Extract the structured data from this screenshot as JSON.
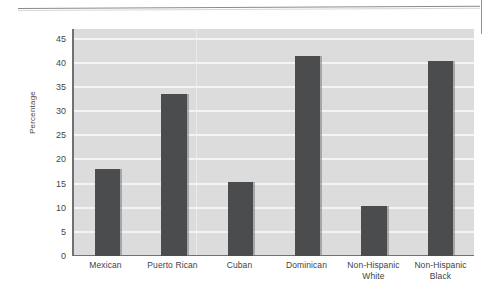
{
  "figure": {
    "type": "scanned-bar-chart",
    "background_color": "#ffffff",
    "plot_background_color": "#dcdcdc",
    "bar_color": "#4b4c4e",
    "gridline_color": "#f4f4f4",
    "axis_color": "#6f7173"
  },
  "chart_data": {
    "type": "bar",
    "title": "",
    "subtitle": "",
    "xlabel": "",
    "ylabel": "Percentage",
    "categories": [
      "Mexican",
      "Puerto Rican",
      "Cuban",
      "Dominican",
      "Non-Hispanic White",
      "Non-Hispanic Black"
    ],
    "category_lines": [
      [
        "Mexican"
      ],
      [
        "Puerto Rican"
      ],
      [
        "Cuban"
      ],
      [
        "Dominican"
      ],
      [
        "Non-Hispanic",
        "White"
      ],
      [
        "Non-Hispanic",
        "Black"
      ]
    ],
    "values": [
      18.0,
      33.6,
      15.4,
      41.4,
      10.4,
      40.3
    ],
    "ylim": [
      0,
      47
    ],
    "yticks": [
      0,
      5,
      10,
      15,
      20,
      25,
      30,
      35,
      40,
      45
    ],
    "ytick_labels": [
      "0",
      "5",
      "10",
      "15",
      "20",
      "25",
      "30",
      "35",
      "40",
      "45"
    ],
    "grid": true,
    "grid_axis": "y",
    "legend": null,
    "legend_position": "none",
    "annotations": []
  }
}
